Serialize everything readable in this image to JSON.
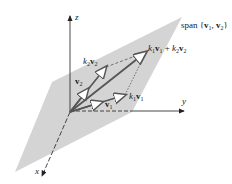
{
  "figure": {
    "type": "vector-span-diagram",
    "plane_label": "span {v1, v2}",
    "axes": {
      "x": "x",
      "y": "y",
      "z": "z"
    },
    "vectors": [
      {
        "id": "v1",
        "label": "v1"
      },
      {
        "id": "v2",
        "label": "v2"
      },
      {
        "id": "k1v1",
        "label": "k1v1"
      },
      {
        "id": "k2v2",
        "label": "k2v2"
      },
      {
        "id": "sum",
        "label": "k1v1 + k2v2"
      }
    ],
    "colors": {
      "plane": "#d4d4d4",
      "vector": "#555555",
      "axis": "#333333"
    }
  }
}
